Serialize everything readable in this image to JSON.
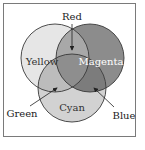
{
  "diagram": {
    "type": "venn",
    "circles": [
      {
        "label": "Yellow",
        "fill": "#e6e6e6",
        "cx": 55,
        "cy": 58,
        "r": 34,
        "text_color": "#333333"
      },
      {
        "label": "Magenta",
        "fill": "#8c8c8c",
        "cx": 90,
        "cy": 58,
        "r": 34,
        "text_color": "#ffffff"
      },
      {
        "label": "Cyan",
        "fill": "#d2d2d2",
        "cx": 72,
        "cy": 88,
        "r": 34,
        "text_color": "#333333"
      }
    ],
    "overlap_fills": {
      "yellow_magenta": "#a8a8a8",
      "yellow_cyan": "#bcbcbc",
      "magenta_cyan": "#7c7c7c",
      "center": "#8e8e8e"
    },
    "callouts": [
      {
        "label": "Red",
        "text_x": 72,
        "text_y": 20,
        "from": [
          72,
          24
        ],
        "to": [
          72,
          50
        ]
      },
      {
        "label": "Green",
        "text_x": 22,
        "text_y": 117,
        "from": [
          30,
          106
        ],
        "to": [
          57,
          88
        ]
      },
      {
        "label": "Blue",
        "text_x": 124,
        "text_y": 119,
        "from": [
          114,
          107
        ],
        "to": [
          94,
          88
        ]
      }
    ],
    "stroke_color": "#3a3a3a",
    "frame_color": "#7a7a7a"
  }
}
